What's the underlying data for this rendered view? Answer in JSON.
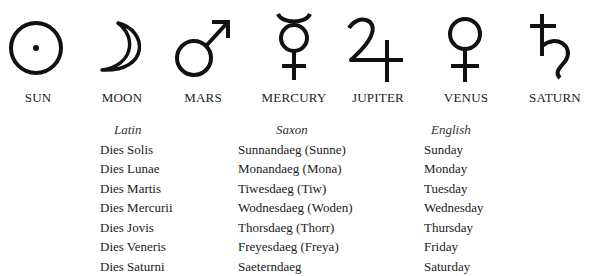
{
  "planets": [
    {
      "name": "SUN",
      "icon": "sun-symbol-icon"
    },
    {
      "name": "MOON",
      "icon": "moon-symbol-icon"
    },
    {
      "name": "MARS",
      "icon": "mars-symbol-icon"
    },
    {
      "name": "MERCURY",
      "icon": "mercury-symbol-icon"
    },
    {
      "name": "JUPITER",
      "icon": "jupiter-symbol-icon"
    },
    {
      "name": "VENUS",
      "icon": "venus-symbol-icon"
    },
    {
      "name": "SATURN",
      "icon": "saturn-symbol-icon"
    }
  ],
  "columns": {
    "latin": {
      "header": "Latin",
      "rows": [
        "Dies Solis",
        "Dies Lunae",
        "Dies Martis",
        "Dies Mercurii",
        "Dies Jovis",
        "Dies Veneris",
        "Dies Saturni"
      ]
    },
    "saxon": {
      "header": "Saxon",
      "rows": [
        "Sunnandaeg (Sunne)",
        "Monandaeg (Mona)",
        "Tiwesdaeg (Tiw)",
        "Wodnesdaeg (Woden)",
        "Thorsdaeg (Thorr)",
        "Freyesdaeg (Freya)",
        "Saeterndaeg"
      ]
    },
    "english": {
      "header": "English",
      "rows": [
        "Sunday",
        "Monday",
        "Tuesday",
        "Wednesday",
        "Thursday",
        "Friday",
        "Saturday"
      ]
    }
  }
}
